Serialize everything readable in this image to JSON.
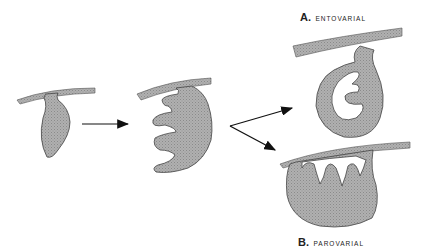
{
  "figure": {
    "type": "developmental diagram",
    "stages": [
      "initial bud",
      "lobed stage",
      "A. entovarial",
      "B. parovarial"
    ],
    "labels": {
      "a_letter": "A.",
      "a_text": "ENTOVARIAL",
      "b_letter": "B.",
      "b_text": "PAROVARIAL"
    },
    "colors": {
      "fill": "#a6a6a6",
      "stroke": "#444444",
      "arrow": "#111111",
      "background": "#ffffff"
    }
  }
}
